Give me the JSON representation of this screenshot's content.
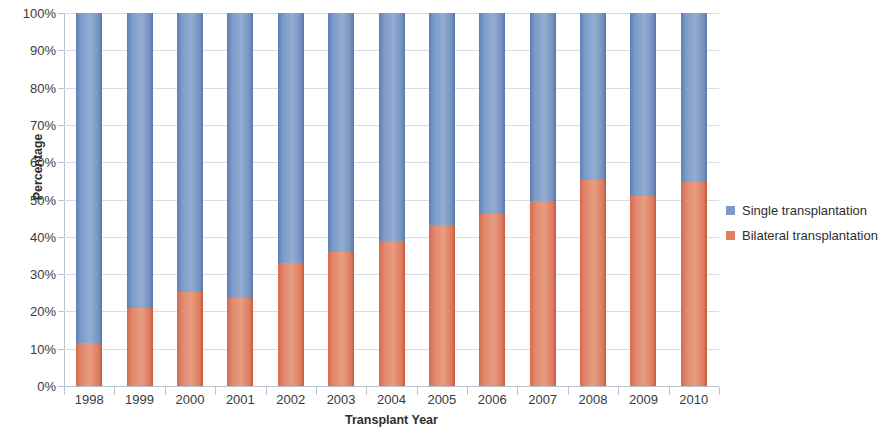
{
  "chart_data": {
    "type": "bar",
    "stacked": true,
    "title": "",
    "xlabel": "Transplant Year",
    "ylabel": "Percentage",
    "categories": [
      "1998",
      "1999",
      "2000",
      "2001",
      "2002",
      "2003",
      "2004",
      "2005",
      "2006",
      "2007",
      "2008",
      "2009",
      "2010"
    ],
    "series": [
      {
        "name": "Bilateral transplantation",
        "color": "#de8165",
        "values": [
          11.5,
          21.0,
          25.3,
          23.5,
          33.0,
          35.8,
          38.9,
          43.2,
          46.2,
          49.6,
          55.2,
          51.0,
          54.6
        ]
      },
      {
        "name": "Single transplantation",
        "color": "#7d99c4",
        "values": [
          88.5,
          79.0,
          74.7,
          76.5,
          67.0,
          64.2,
          61.1,
          56.8,
          53.8,
          50.4,
          44.8,
          49.0,
          45.4
        ]
      }
    ],
    "ylim": [
      0,
      100
    ],
    "y_ticks": [
      "0%",
      "10%",
      "20%",
      "30%",
      "40%",
      "50%",
      "60%",
      "70%",
      "80%",
      "90%",
      "100%"
    ],
    "y_tick_values": [
      0,
      10,
      20,
      30,
      40,
      50,
      60,
      70,
      80,
      90,
      100
    ],
    "grid": true,
    "legend_position": "right",
    "legend": [
      {
        "label": "Single transplantation",
        "color": "#7d99c4",
        "swatch": "legend-swatch-single"
      },
      {
        "label": "Bilateral transplantation",
        "color": "#de8165",
        "swatch": "legend-swatch-bilateral"
      }
    ]
  }
}
